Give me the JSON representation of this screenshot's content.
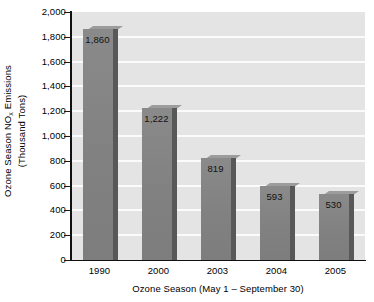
{
  "chart_data": {
    "type": "bar",
    "title": "",
    "subtitle": "",
    "xlabel": "Ozone Season (May 1 – September 30)",
    "ylabel_line1": "Ozone Season NO",
    "ylabel_sub": "x",
    "ylabel_line1_tail": " Emissions",
    "ylabel_line2": "(Thousand Tons)",
    "categories": [
      "1990",
      "2000",
      "2003",
      "2004",
      "2005"
    ],
    "values": [
      1860,
      1222,
      819,
      593,
      530
    ],
    "value_labels": [
      "1,860",
      "1,222",
      "819",
      "593",
      "530"
    ],
    "ylim": [
      0,
      2000
    ],
    "ytick_values": [
      0,
      200,
      400,
      600,
      800,
      1000,
      1200,
      1400,
      1600,
      1800,
      2000
    ],
    "ytick_labels": [
      "0",
      "200",
      "400",
      "600",
      "800",
      "1,000",
      "1,200",
      "1,400",
      "1,600",
      "1,800",
      "2,000"
    ],
    "grid": "horizontal",
    "legend": "none",
    "legend_position": "none",
    "bar_style": "3d-extruded",
    "colors": {
      "bar_front": "#838383",
      "bar_side": "#585858",
      "bar_top": "#9c9c9c",
      "plot_background": "#e4e4e4",
      "gridline": "#fbfbfb",
      "axis": "#111111",
      "text": "#000000"
    }
  }
}
